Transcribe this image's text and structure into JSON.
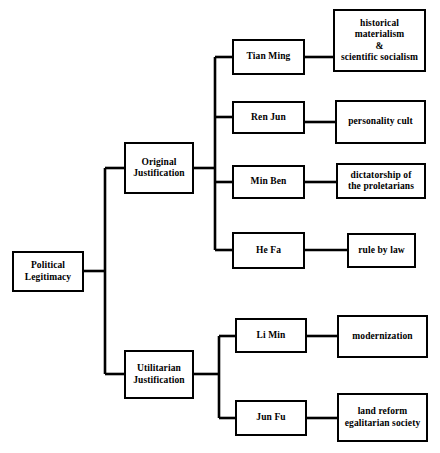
{
  "diagram": {
    "title": "Political Legitimacy",
    "type": "hierarchical-tree",
    "orientation": "left-to-right",
    "line_color": "#000000",
    "box_border_color": "#000000",
    "box_fill_color": "#ffffff",
    "background_color": "#ffffff",
    "levels": 4
  },
  "nodes": {
    "root": {
      "label": "Political\nLegitimacy",
      "x": 12,
      "y": 251,
      "w": 72,
      "h": 41
    },
    "branch_original": {
      "label": "Original\nJustification",
      "x": 124,
      "y": 142,
      "w": 70,
      "h": 52
    },
    "branch_utilitarian": {
      "label": "Utilitarian\nJustification",
      "x": 124,
      "y": 350,
      "w": 70,
      "h": 49
    },
    "concept_tian_ming": {
      "label": "Tian Ming",
      "x": 232,
      "y": 39,
      "w": 73,
      "h": 36
    },
    "concept_ren_jun": {
      "label": "Ren Jun",
      "x": 232,
      "y": 101,
      "w": 73,
      "h": 33
    },
    "concept_min_ben": {
      "label": "Min Ben",
      "x": 232,
      "y": 165,
      "w": 73,
      "h": 34
    },
    "concept_he_fa": {
      "label": "He Fa",
      "x": 232,
      "y": 232,
      "w": 73,
      "h": 37
    },
    "concept_li_min": {
      "label": "Li Min",
      "x": 235,
      "y": 318,
      "w": 72,
      "h": 35
    },
    "concept_jun_fu": {
      "label": "Jun Fu",
      "x": 235,
      "y": 400,
      "w": 72,
      "h": 36
    },
    "outcome_historical_materialism": {
      "label": "historical\nmaterialism\n&\nscientific socialism",
      "x": 333,
      "y": 9,
      "w": 93,
      "h": 63
    },
    "outcome_personality_cult": {
      "label": "personality cult",
      "x": 335,
      "y": 100,
      "w": 91,
      "h": 44
    },
    "outcome_dictatorship": {
      "label": "dictatorship of\nthe proletarians",
      "x": 336,
      "y": 163,
      "w": 90,
      "h": 36
    },
    "outcome_rule_by_law": {
      "label": "rule by law",
      "x": 347,
      "y": 233,
      "w": 69,
      "h": 35
    },
    "outcome_modernization": {
      "label": "modernization",
      "x": 337,
      "y": 315,
      "w": 91,
      "h": 43
    },
    "outcome_land_reform": {
      "label": "land reform\negalitarian society",
      "x": 337,
      "y": 393,
      "w": 91,
      "h": 49
    }
  },
  "connectors": {
    "root_trunk_x": 105,
    "branch_trunk_x": 215,
    "utilitarian_trunk_x": 219,
    "stroke_width": 2.6
  }
}
